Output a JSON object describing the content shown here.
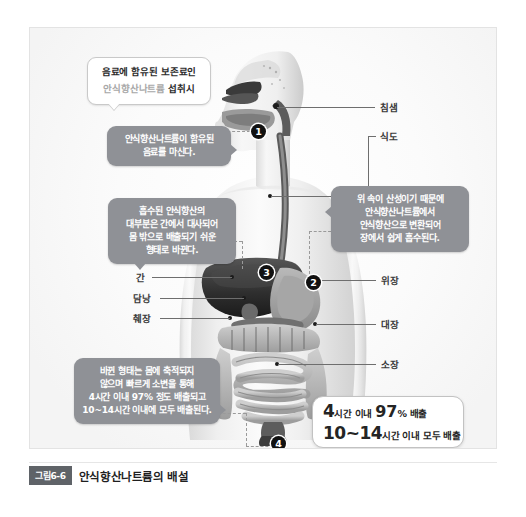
{
  "figure": {
    "caption_badge": "그림6-6",
    "caption_text": "안식향산나트륨의 배설",
    "background_color": "#ffffff",
    "panel_border_color": "#e3e3e3"
  },
  "callouts": {
    "intro": {
      "line1": "음료에 함유된 보존료인",
      "line2_muted": "안식향산나트륨",
      "line2_bold": " 섭취시",
      "style": "white"
    },
    "step1": {
      "lines": [
        "안식향산나트륨이 함유된",
        "음료를 마신다."
      ],
      "style": "gray",
      "color": "#8f9196"
    },
    "step3": {
      "lines": [
        "흡수된 안식향산의",
        "대부분은 간에서 대사되어",
        "몸 밖으로 배출되기 쉬운",
        "형태로 바뀐다."
      ],
      "style": "gray",
      "color": "#8f9196"
    },
    "step2": {
      "lines": [
        "위 속이 산성이기 때문에",
        "안식향산나트륨에서",
        "안식향산으로 변환되어",
        "장에서 쉽게 흡수된다."
      ],
      "style": "gray",
      "color": "#8f9196"
    },
    "step4": {
      "lines": [
        "바뀐 형태는 몸에 축적되지",
        "않으며 빠르게 소변을 통해",
        "4시간 이내 97% 정도 배출되고",
        "10~14시간 이내에 모두 배출된다."
      ],
      "style": "gray",
      "color": "#8f9196"
    }
  },
  "result": {
    "line1": {
      "number": "4",
      "unit": "시간 이내 ",
      "percent": "97",
      "percent_sign": "%",
      "tail": " 배출"
    },
    "line2": {
      "number": "10~14",
      "tail": "시간 이내 모두 배출"
    }
  },
  "markers": [
    {
      "id": "1",
      "label": "1"
    },
    {
      "id": "2",
      "label": "2"
    },
    {
      "id": "3",
      "label": "3"
    },
    {
      "id": "4",
      "label": "4"
    }
  ],
  "organ_labels": {
    "right": [
      {
        "name": "salivary-gland",
        "text": "침샘"
      },
      {
        "name": "esophagus",
        "text": "식도"
      },
      {
        "name": "stomach",
        "text": "위장"
      },
      {
        "name": "large-intestine",
        "text": "대장"
      },
      {
        "name": "small-intestine",
        "text": "소장"
      }
    ],
    "left": [
      {
        "name": "liver",
        "text": "간"
      },
      {
        "name": "gallbladder",
        "text": "담낭"
      },
      {
        "name": "pancreas",
        "text": "췌장"
      }
    ]
  }
}
